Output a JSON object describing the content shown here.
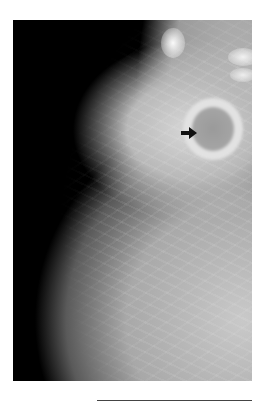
{
  "figure": {
    "colors": {
      "background": "#000000",
      "tissue": "#b8b8b8",
      "arrow": "#111111",
      "page": "#ffffff"
    },
    "annotation": {
      "type": "arrow-icon",
      "direction": "right"
    }
  }
}
